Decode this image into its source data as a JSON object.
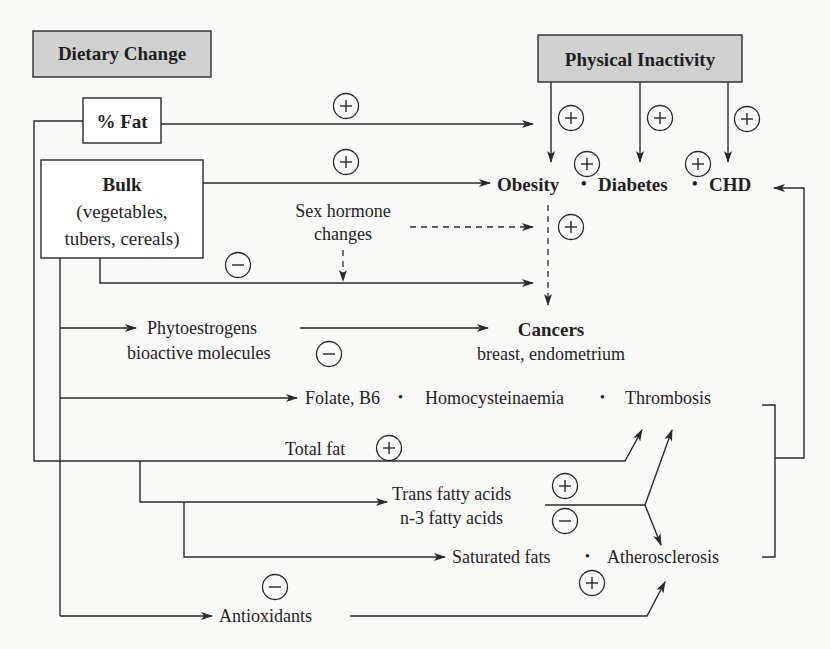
{
  "header_boxes": {
    "dietary_change": "Dietary Change",
    "physical_inactivity": "Physical Inactivity"
  },
  "source_boxes": {
    "percent_fat": "% Fat",
    "bulk_title": "Bulk",
    "bulk_line1": "(vegetables,",
    "bulk_line2": "tubers, cereals)"
  },
  "outcomes": {
    "obesity": "Obesity",
    "diabetes": "Diabetes",
    "chd": "CHD",
    "separator": "•",
    "cancers": "Cancers",
    "cancers_detail": "breast, endometrium"
  },
  "intermediates": {
    "sex_hormone_line1": "Sex hormone",
    "sex_hormone_line2": "changes",
    "phytoestrogens": "Phytoestrogens",
    "bioactive": "bioactive molecules",
    "folate_b6": "Folate, B6",
    "homocysteinaemia": "Homocysteinaemia",
    "thrombosis": "Thrombosis",
    "total_fat": "Total fat",
    "trans_fatty_acids": "Trans fatty acids",
    "n3_fatty_acids": "n-3 fatty acids",
    "saturated_fats": "Saturated fats",
    "atherosclerosis": "Atherosclerosis",
    "antioxidants": "Antioxidants"
  },
  "signs": {
    "plus": "+",
    "minus": "−"
  },
  "effect_markers": [
    {
      "id": "fat-to-obesity",
      "sign": "plus"
    },
    {
      "id": "bulk-to-obesity",
      "sign": "plus"
    },
    {
      "id": "inactivity-obesity",
      "sign": "plus"
    },
    {
      "id": "inactivity-diabetes",
      "sign": "plus"
    },
    {
      "id": "inactivity-chd",
      "sign": "plus"
    },
    {
      "id": "obesity-diabetes",
      "sign": "plus"
    },
    {
      "id": "diabetes-chd",
      "sign": "plus"
    },
    {
      "id": "obesity-cancers",
      "sign": "plus"
    },
    {
      "id": "bulk-cancers",
      "sign": "minus"
    },
    {
      "id": "phytoestrogens-cancers",
      "sign": "minus"
    },
    {
      "id": "total-fat-thrombosis",
      "sign": "plus"
    },
    {
      "id": "trans-fatty-acids",
      "sign": "plus"
    },
    {
      "id": "n3-fatty-acids",
      "sign": "minus"
    },
    {
      "id": "saturated-fats",
      "sign": "plus"
    },
    {
      "id": "antioxidants",
      "sign": "minus"
    }
  ],
  "colors": {
    "header_fill": "#d0d0d0",
    "line": "#2a2a2a",
    "background": "#f9f9f8"
  }
}
